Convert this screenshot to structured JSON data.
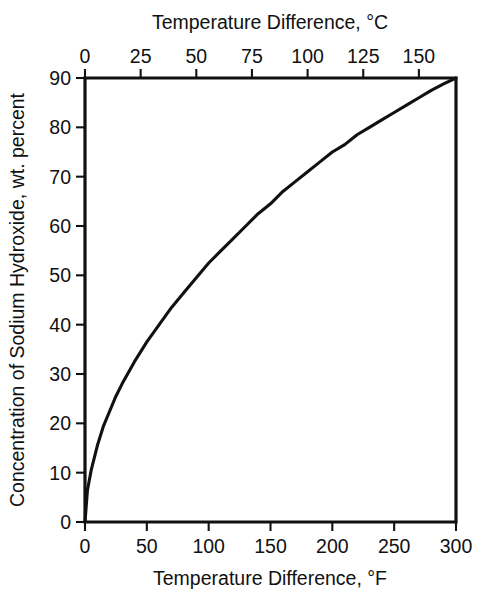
{
  "chart_data": {
    "type": "line",
    "title": "",
    "xlabel": "Temperature Difference, °F",
    "xlabel_top": "Temperature Difference, °C",
    "ylabel": "Concentration of Sodium Hydroxide, wt. percent",
    "xlim": [
      0,
      300
    ],
    "xlim_top": [
      0,
      166.67
    ],
    "ylim": [
      0,
      90
    ],
    "grid": false,
    "legend": null,
    "x_ticks": [
      0,
      50,
      100,
      150,
      200,
      250,
      300
    ],
    "x_tick_labels": [
      "0",
      "50",
      "100",
      "150",
      "200",
      "250",
      "300"
    ],
    "x_top_ticks": [
      0,
      25,
      50,
      75,
      100,
      125,
      150
    ],
    "x_top_tick_labels": [
      "0",
      "25",
      "50",
      "75",
      "100",
      "125",
      "150"
    ],
    "y_ticks": [
      0,
      10,
      20,
      30,
      40,
      50,
      60,
      70,
      80,
      90
    ],
    "y_tick_labels": [
      "0",
      "10",
      "20",
      "30",
      "40",
      "50",
      "60",
      "70",
      "80",
      "90"
    ],
    "series": [
      {
        "name": "boiling point elevation",
        "color": "#111111",
        "x": [
          0,
          2,
          5,
          10,
          15,
          20,
          25,
          30,
          40,
          50,
          60,
          70,
          80,
          90,
          100,
          110,
          120,
          130,
          140,
          150,
          160,
          170,
          180,
          190,
          200,
          210,
          220,
          230,
          240,
          250,
          260,
          270,
          280,
          290,
          300
        ],
        "y": [
          0,
          6.5,
          10.5,
          15.5,
          19.5,
          22.5,
          25.5,
          28.0,
          32.5,
          36.5,
          40.0,
          43.5,
          46.5,
          49.5,
          52.5,
          55.0,
          57.5,
          60.0,
          62.5,
          64.5,
          67.0,
          69.0,
          71.0,
          73.0,
          75.0,
          76.5,
          78.5,
          80.0,
          81.5,
          83.0,
          84.5,
          86.0,
          87.5,
          88.8,
          90.0
        ]
      }
    ]
  },
  "figure": {
    "background": "#ffffff",
    "axis_color": "#111111",
    "line_color": "#111111"
  }
}
